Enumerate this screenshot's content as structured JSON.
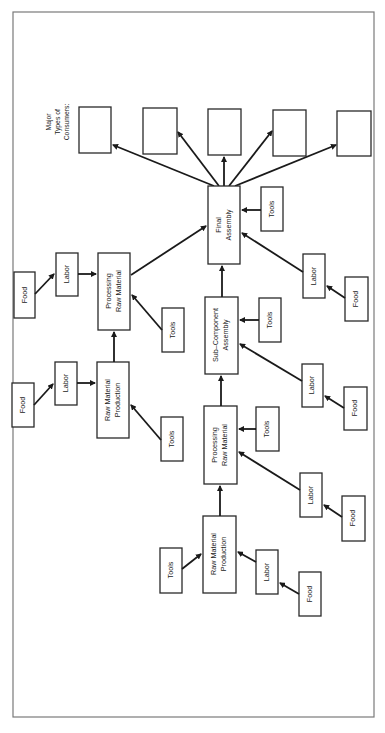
{
  "diagram": {
    "orientation": "rotated 90 degrees counter-clockwise",
    "consumers_header": [
      "Major",
      "Types of",
      "Consumers:"
    ],
    "nodes": {
      "final_assembly": [
        "Final",
        "Assembly"
      ],
      "sub_component_assembly": [
        "Sub–Component",
        "Assembly"
      ],
      "processing_raw_material_a": [
        "Processing",
        "Raw Material"
      ],
      "raw_material_production_a": [
        "Raw Material",
        "Production"
      ],
      "processing_raw_material_b": [
        "Processing",
        "Raw Material"
      ],
      "raw_material_production_b": [
        "Raw Material",
        "Production"
      ],
      "tools": "Tools",
      "labor": "Labor",
      "food": "Food"
    },
    "consumer_boxes": [
      "",
      "",
      "",
      "",
      ""
    ],
    "colors": {
      "line": "#1a1a1a",
      "box_stroke": "#2a2a2a",
      "frame": "#7a7a7a",
      "background": "#ffffff"
    }
  }
}
